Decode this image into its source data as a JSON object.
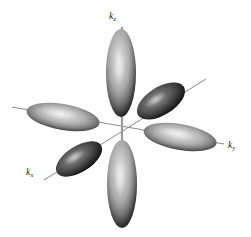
{
  "figure": {
    "name": "momentum-space-orbital-lobes",
    "background_color": "#ffffff",
    "width": 251,
    "height": 237,
    "origin": {
      "x": 122,
      "y": 127
    }
  },
  "axes": [
    {
      "id": "kz",
      "label_base": "k",
      "label_sub": "z",
      "label_text": "kz",
      "direction": "vertical",
      "color": "#8c8c8c",
      "line": {
        "x1": 122,
        "y1": 27,
        "x2": 122,
        "y2": 227
      },
      "label_position": {
        "x": 109,
        "y": 12
      }
    },
    {
      "id": "ky",
      "label_base": "k",
      "label_sub": "y",
      "label_text": "ky",
      "direction": "right-descending",
      "color": "#7d7d7d",
      "line": {
        "x1": 12,
        "y1": 107,
        "x2": 224,
        "y2": 144
      },
      "label_position": {
        "x": 228,
        "y": 141
      }
    },
    {
      "id": "kx",
      "label_base": "k",
      "label_sub": "x",
      "label_text": "kx",
      "direction": "lower-left-diagonal",
      "color": "#7d7d7d",
      "line": {
        "x1": 44,
        "y1": 180,
        "x2": 206,
        "y2": 79
      },
      "label_position": {
        "x": 26,
        "y": 168
      }
    }
  ],
  "lobes": [
    {
      "id": "lobe-kz-positive",
      "axis": "kz",
      "sign": "positive",
      "center": {
        "x": 121,
        "y": 73
      },
      "radius_x": 15,
      "radius_y": 44,
      "rotation_deg": 0,
      "shade": "light",
      "core_color": "#c9c9c9",
      "edge_color": "#2b2b2b"
    },
    {
      "id": "lobe-kz-negative",
      "axis": "kz",
      "sign": "negative",
      "center": {
        "x": 122,
        "y": 184
      },
      "radius_x": 15,
      "radius_y": 44,
      "rotation_deg": 0,
      "shade": "light",
      "core_color": "#c6c6c6",
      "edge_color": "#272727"
    },
    {
      "id": "lobe-ky-positive",
      "axis": "ky",
      "sign": "positive",
      "center": {
        "x": 180,
        "y": 137
      },
      "radius_x": 37,
      "radius_y": 13,
      "rotation_deg": 10,
      "shade": "light",
      "core_color": "#cacaca",
      "edge_color": "#2d2d2d"
    },
    {
      "id": "lobe-ky-negative",
      "axis": "ky",
      "sign": "negative",
      "center": {
        "x": 63,
        "y": 117
      },
      "radius_x": 37,
      "radius_y": 13,
      "rotation_deg": 10,
      "shade": "light",
      "core_color": "#c4c4c4",
      "edge_color": "#2a2a2a"
    },
    {
      "id": "lobe-kx-positive",
      "axis": "kx",
      "sign": "positive",
      "center": {
        "x": 79,
        "y": 159
      },
      "radius_x": 26,
      "radius_y": 13,
      "rotation_deg": -32,
      "shade": "dark",
      "core_color": "#6e6e6e",
      "edge_color": "#1c1c1c"
    },
    {
      "id": "lobe-kx-negative",
      "axis": "kx",
      "sign": "negative",
      "center": {
        "x": 161,
        "y": 101
      },
      "radius_x": 27,
      "radius_y": 14,
      "rotation_deg": -32,
      "shade": "dark",
      "core_color": "#6a6a6a",
      "edge_color": "#1a1a1a"
    }
  ]
}
